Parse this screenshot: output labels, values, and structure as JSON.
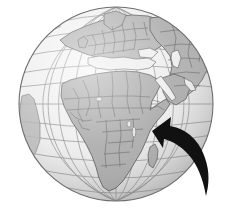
{
  "image": {
    "title": "World globe centered on Africa with pointing arrow",
    "width": 231,
    "height": 215,
    "background_color": "#ffffff",
    "description": "Grayscale orthographic globe showing Africa, Europe and western Asia, cropped top and bottom, with a curved black arrow pointing at central-southern Africa from the lower right"
  },
  "globe": {
    "label": "Earth globe",
    "projection": "orthographic",
    "center_x": 116,
    "center_y": 104,
    "radius": 97,
    "ocean_color": "#eeeeee",
    "ocean_shadow_color": "#cfcfcf",
    "land_color": "#a9a9a9",
    "land_highlight_color": "#bdbdbd",
    "border_color": "#5d5d5d",
    "outline_color": "#6e6e6e",
    "graticule_color": "#8c8c8c",
    "graticule": {
      "label": "latitude and longitude grid",
      "visible": true,
      "meridian_spacing_degrees": 15,
      "parallel_spacing_degrees": 15,
      "line_width": 0.8
    }
  },
  "landmasses": [
    {
      "name": "africa",
      "label": "Africa",
      "emphasis": "primary"
    },
    {
      "name": "europe",
      "label": "Europe",
      "emphasis": "secondary"
    },
    {
      "name": "asia-west",
      "label": "Western Asia",
      "emphasis": "secondary"
    },
    {
      "name": "arabian-peninsula",
      "label": "Arabian Peninsula",
      "emphasis": "secondary"
    },
    {
      "name": "madagascar",
      "label": "Madagascar",
      "emphasis": "secondary"
    },
    {
      "name": "south-america-limb",
      "label": "South America",
      "emphasis": "faint"
    },
    {
      "name": "greenland",
      "label": "Greenland",
      "emphasis": "faint"
    }
  ],
  "arrow": {
    "label": "Pointer arrow to Africa",
    "color": "#111111",
    "points_to": "central southern Africa",
    "tip_x": 152,
    "tip_y": 131,
    "tail_x": 206,
    "tail_y": 196,
    "style": "curved solid"
  }
}
